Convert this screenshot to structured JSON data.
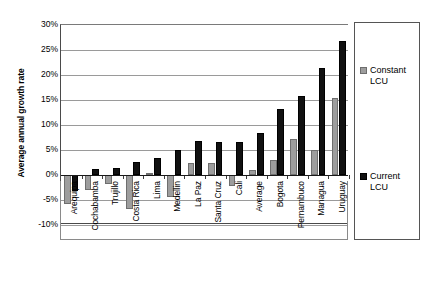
{
  "chart_data": {
    "type": "bar",
    "title": "",
    "xlabel": "",
    "ylabel": "Average annual growth rate",
    "ylim": [
      -10,
      30
    ],
    "ytick_step": 5,
    "ytick_labels": [
      "30%",
      "25%",
      "20%",
      "15%",
      "10%",
      "5%",
      "0%",
      "-5%",
      "-10%"
    ],
    "ytick_values": [
      30,
      25,
      20,
      15,
      10,
      5,
      0,
      -5,
      -10
    ],
    "grid": true,
    "legend_position": "right",
    "categories": [
      "Arequipa",
      "Cochabamba",
      "Trujillo",
      "Costa Rica",
      "Lima",
      "Medellin",
      "La Paz",
      "Santa Cruz",
      "Cali",
      "Average",
      "Bogota",
      "Pernambuco",
      "Managua",
      "Uruguay"
    ],
    "series": [
      {
        "name": "Constant LCU",
        "color": "#9d9d9d",
        "values": [
          -5.8,
          -3.0,
          -1.7,
          -6.8,
          0.4,
          -4.3,
          2.4,
          2.4,
          -2.1,
          1.0,
          3.0,
          7.2,
          5.0,
          15.5
        ]
      },
      {
        "name": "Current LCU",
        "color": "#111111",
        "values": [
          -3.2,
          1.2,
          1.4,
          2.6,
          3.4,
          5.0,
          6.8,
          6.7,
          6.7,
          8.4,
          13.2,
          15.9,
          21.5,
          26.9
        ]
      }
    ]
  },
  "legend": {
    "entries": [
      {
        "label": "Constant\nLCU",
        "swatch": "constant"
      },
      {
        "label": "Current\nLCU",
        "swatch": "current"
      }
    ]
  }
}
